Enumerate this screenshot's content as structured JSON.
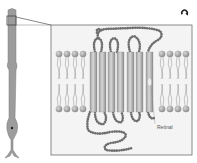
{
  "figure": {
    "labels": {
      "retinal": "Retinal"
    },
    "icon": "replay-arrow-icon",
    "helix_count": 7,
    "colors": {
      "panel_border": "#6e6e6e",
      "panel_fill": "#f4f4f4",
      "helix": "#bdbdbd",
      "beads": "#7a7a7a",
      "lipid_head": "#a9a9a9",
      "rod_cell": "#9a9a9a"
    }
  }
}
